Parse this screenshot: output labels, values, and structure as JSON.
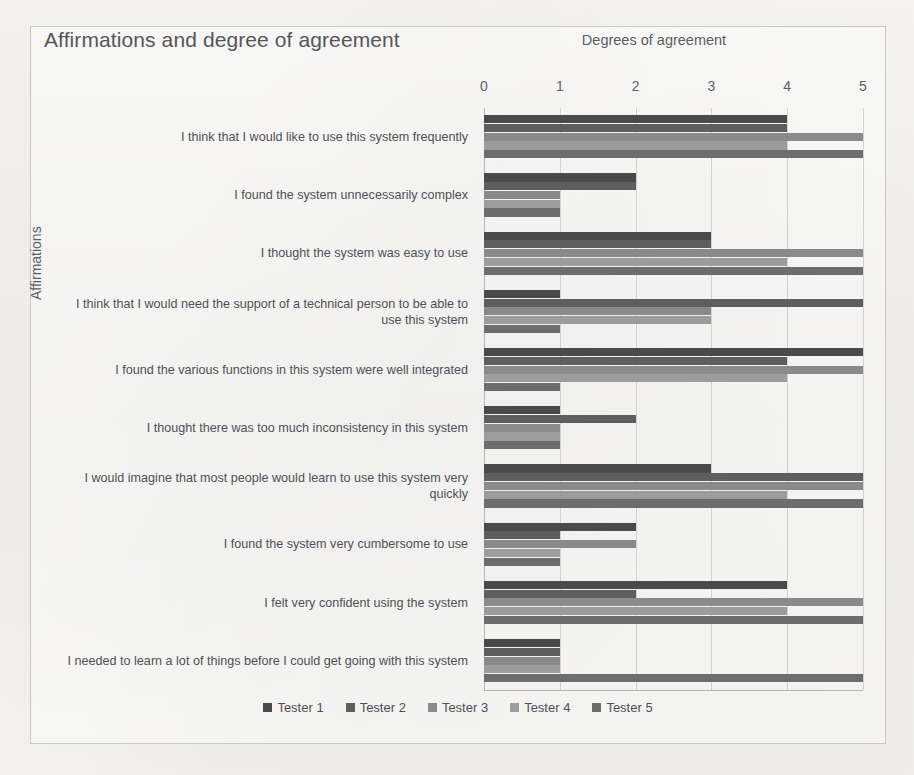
{
  "chart_data": {
    "type": "bar",
    "orientation": "horizontal",
    "title": "Affirmations and degree of agreement",
    "xlabel": "Degrees of agreement",
    "ylabel": "Affirmations",
    "xlim": [
      0,
      5
    ],
    "xticks": [
      0,
      1,
      2,
      3,
      4,
      5
    ],
    "xtick_labels": [
      "0",
      "1",
      "2",
      "3",
      "4",
      "5"
    ],
    "grid": true,
    "grid_axis": "x",
    "legend_position": "bottom-center",
    "categories": [
      "I think that I would like to use this system frequently",
      "I found the system unnecessarily complex",
      "I thought the system was easy to use",
      "I think that I would need the support of a technical person to be able to use this system",
      "I found the various functions in this system were well integrated",
      "I thought there was too much inconsistency in this system",
      "I would imagine that most people would learn to use this system very quickly",
      "I found the system very cumbersome to use",
      "I felt very confident using the system",
      "I needed to learn a lot of things before I could get going with this system"
    ],
    "series": [
      {
        "name": "Tester 1",
        "color": "#4a4a4a",
        "values": [
          4,
          2,
          3,
          1,
          5,
          1,
          3,
          2,
          4,
          1
        ]
      },
      {
        "name": "Tester 2",
        "color": "#5e5e5e",
        "values": [
          4,
          2,
          3,
          5,
          4,
          2,
          5,
          1,
          2,
          1
        ]
      },
      {
        "name": "Tester 3",
        "color": "#8a8a8a",
        "values": [
          5,
          1,
          5,
          3,
          5,
          1,
          5,
          2,
          5,
          1
        ]
      },
      {
        "name": "Tester 4",
        "color": "#9c9c9c",
        "values": [
          4,
          1,
          4,
          3,
          4,
          1,
          4,
          1,
          4,
          1
        ]
      },
      {
        "name": "Tester 5",
        "color": "#6d6d6d",
        "values": [
          5,
          1,
          5,
          1,
          1,
          1,
          5,
          1,
          5,
          5
        ]
      }
    ]
  },
  "legend": {
    "entries": [
      {
        "label": "Tester 1",
        "color": "#4a4a4a"
      },
      {
        "label": "Tester 2",
        "color": "#5e5e5e"
      },
      {
        "label": "Tester 3",
        "color": "#8a8a8a"
      },
      {
        "label": "Tester 4",
        "color": "#9c9c9c"
      },
      {
        "label": "Tester 5",
        "color": "#6d6d6d"
      }
    ]
  }
}
